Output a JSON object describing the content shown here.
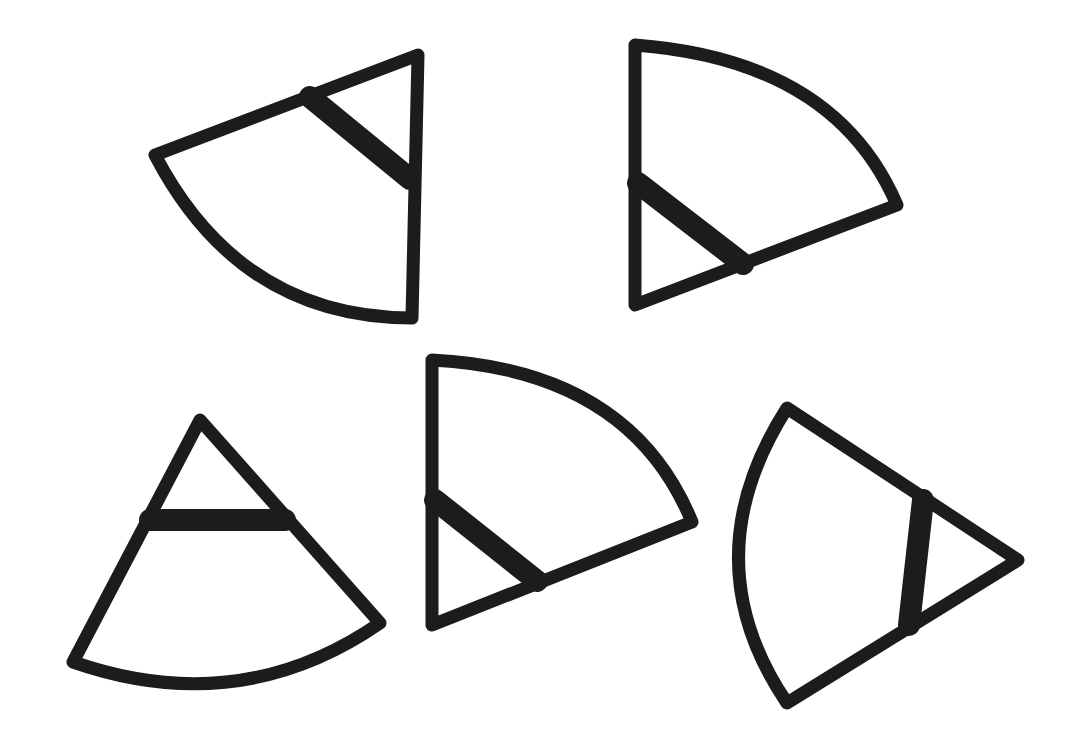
{
  "figure": {
    "stroke_color": "#1c1c1c",
    "background": "#ffffff",
    "shapes": [
      {
        "id": "shape-1",
        "position": "top-left",
        "apex": [
          418,
          55
        ],
        "arc_start": [
          155,
          155
        ],
        "arc_end": [
          412,
          318
        ],
        "bar": [
          [
            310,
            97
          ],
          [
            412,
            180
          ]
        ]
      },
      {
        "id": "shape-2",
        "position": "top-right",
        "apex": [
          635,
          305
        ],
        "arc_start": [
          635,
          45
        ],
        "arc_end": [
          897,
          205
        ],
        "bar": [
          [
            636,
            182
          ],
          [
            744,
            265
          ]
        ]
      },
      {
        "id": "shape-3",
        "position": "bottom-left",
        "apex": [
          200,
          420
        ],
        "arc_start": [
          73,
          662
        ],
        "arc_end": [
          380,
          623
        ],
        "bar": [
          [
            147,
            520
          ],
          [
            287,
            520
          ]
        ]
      },
      {
        "id": "shape-4",
        "position": "bottom-center",
        "apex": [
          432,
          625
        ],
        "arc_start": [
          432,
          360
        ],
        "arc_end": [
          692,
          522
        ],
        "bar": [
          [
            433,
            497
          ],
          [
            538,
            582
          ]
        ]
      },
      {
        "id": "shape-5",
        "position": "bottom-right",
        "apex": [
          1018,
          560
        ],
        "arc_start": [
          787,
          408
        ],
        "arc_end": [
          787,
          703
        ],
        "bar": [
          [
            924,
            498
          ],
          [
            908,
            628
          ]
        ]
      }
    ]
  }
}
